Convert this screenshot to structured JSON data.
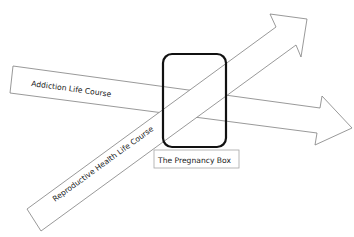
{
  "diagram": {
    "arrows": [
      {
        "id": "addiction",
        "label": "Addiction Life Course",
        "direction": "right-slightly-down"
      },
      {
        "id": "reproductive",
        "label": "Reproductive Health Life Course",
        "direction": "up-right"
      }
    ],
    "box": {
      "label": "The Pregnancy Box"
    },
    "colors": {
      "arrow_stroke": "#7f7f7f",
      "box_stroke": "#111111",
      "label_border": "#a6a6a6"
    }
  }
}
